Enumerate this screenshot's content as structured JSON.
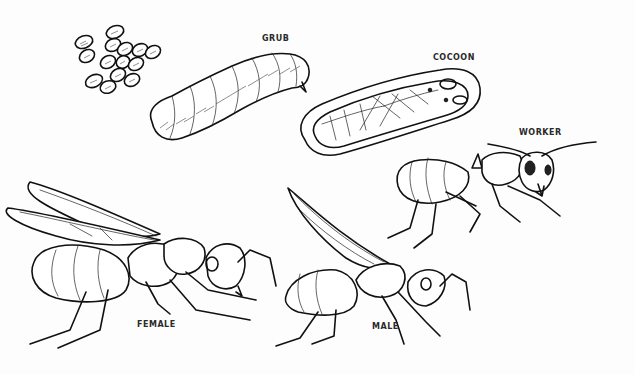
{
  "illustration": {
    "subject": "Ant life cycle",
    "background": "#fdfdfd",
    "ink": "#111111",
    "stages": [
      {
        "id": "eggs",
        "label": "",
        "x": 95,
        "y": 55
      },
      {
        "id": "grub",
        "label": "GRUB",
        "x": 262,
        "y": 38
      },
      {
        "id": "cocoon",
        "label": "COCOON",
        "x": 433,
        "y": 52
      },
      {
        "id": "worker",
        "label": "WORKER",
        "x": 519,
        "y": 128
      },
      {
        "id": "female",
        "label": "FEMALE",
        "x": 137,
        "y": 321
      },
      {
        "id": "male",
        "label": "MALE",
        "x": 372,
        "y": 322
      }
    ]
  }
}
